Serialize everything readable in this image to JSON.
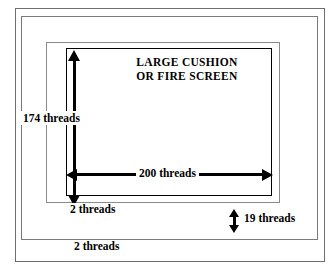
{
  "diagram": {
    "kind": "embroidery-canvas-sizing-diagram",
    "title_line1": "LARGE CUSHION",
    "title_line2": "OR FIRE SCREEN",
    "measurements": {
      "height_label": "174 threads",
      "width_label": "200 threads",
      "inner_margin_label": "2 threads",
      "outer_margin_label": "19 threads",
      "bottom_margin_label": "2 threads"
    },
    "colors": {
      "ink": "#000000",
      "frame_line": "#6e6e6e",
      "background": "#ffffff"
    }
  },
  "chart_data": {
    "type": "diagram",
    "title": "LARGE CUSHION OR FIRE SCREEN",
    "subtitle": "",
    "xlabel": "",
    "ylabel": "",
    "annotations": [
      {
        "name": "design-height",
        "text": "174 threads",
        "value": 174,
        "unit": "threads",
        "orientation": "vertical"
      },
      {
        "name": "design-width",
        "text": "200 threads",
        "value": 200,
        "unit": "threads",
        "orientation": "horizontal"
      },
      {
        "name": "inner-border",
        "text": "2 threads",
        "value": 2,
        "unit": "threads",
        "orientation": "none"
      },
      {
        "name": "outer-border",
        "text": "19 threads",
        "value": 19,
        "unit": "threads",
        "orientation": "vertical"
      },
      {
        "name": "outermost-border",
        "text": "2 threads",
        "value": 2,
        "unit": "threads",
        "orientation": "none"
      }
    ],
    "frames": [
      {
        "name": "outermost-frame",
        "level": 1
      },
      {
        "name": "second-frame",
        "level": 2
      },
      {
        "name": "third-frame",
        "level": 3
      },
      {
        "name": "design-area-frame",
        "level": 4
      }
    ],
    "grid": false,
    "legend": "none"
  }
}
